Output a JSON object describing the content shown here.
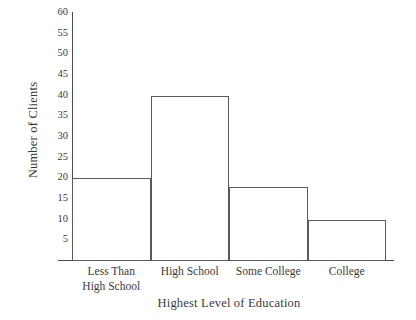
{
  "chart_data": {
    "type": "bar",
    "title": "",
    "xlabel": "Highest Level of Education",
    "ylabel": "Number of Clients",
    "categories": [
      "Less Than\nHigh School",
      "High School",
      "Some College",
      "College"
    ],
    "values": [
      20,
      40,
      18,
      10
    ],
    "ylim": [
      0,
      60
    ],
    "ytick_step": 5,
    "yticks": [
      5,
      10,
      15,
      20,
      25,
      30,
      35,
      40,
      45,
      50,
      55,
      60
    ],
    "ytick_labels": [
      "5",
      "10",
      "15",
      "20",
      "25",
      "30",
      "35",
      "40",
      "45",
      "50",
      "55",
      "60"
    ],
    "grid": false,
    "legend": null,
    "bar_style": {
      "fill": "none",
      "edge_color": "#5a5a5a",
      "edge_width": 1,
      "contiguous": true
    },
    "axis_color": "#4a4a4a",
    "background": "#ffffff",
    "text_color": "#3a3a3a"
  }
}
